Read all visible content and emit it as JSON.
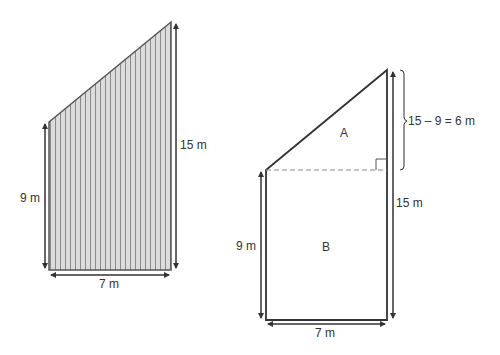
{
  "left_figure": {
    "name": "Trapezium (shaded)",
    "left_side_label": "9 m",
    "right_side_label": "15 m",
    "base_label": "7 m"
  },
  "right_figure": {
    "name": "Trapezium split into triangle and rectangle",
    "region_a_label": "A",
    "region_b_label": "B",
    "left_side_label": "9 m",
    "right_side_label": "15 m",
    "base_label": "7 m",
    "triangle_height_label": "15 – 9 = 6 m"
  },
  "colors": {
    "outline": "#333333",
    "hatch_fill": "#dcdcdc",
    "hatch_line": "#8a8a8a",
    "dash": "#888888"
  }
}
